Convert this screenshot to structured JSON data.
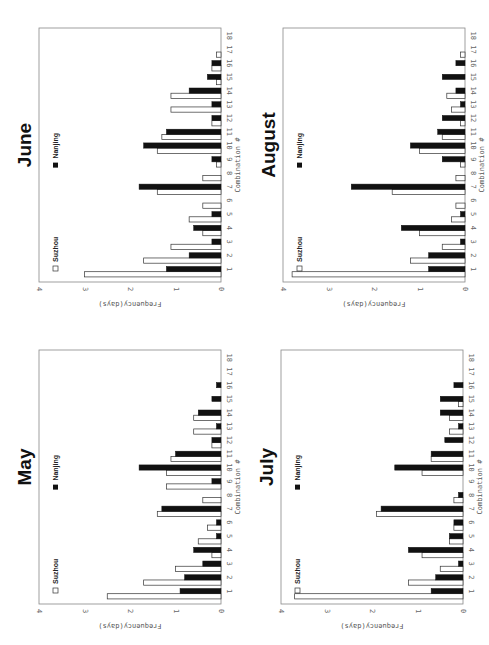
{
  "figure": {
    "orientation": "rotated 90deg clockwise (bars horizontal in screenshot)",
    "legend": {
      "suzhou_label": "Suzhou",
      "nanjing_label": "Nanjing"
    },
    "xlabel": "Combination #",
    "ylabel": "Frequency(days)",
    "colors": {
      "suzhou": "#ffffff",
      "nanjing": "#111111",
      "frame": "#888888"
    }
  },
  "chart_data": [
    {
      "type": "bar",
      "title": "June",
      "xlabel": "Combination #",
      "ylabel": "Frequency(days)",
      "ylim": [
        0,
        4
      ],
      "categories": [
        "1",
        "2",
        "3",
        "4",
        "5",
        "6",
        "7",
        "8",
        "9",
        "10",
        "11",
        "12",
        "13",
        "14",
        "15",
        "16",
        "17",
        "18"
      ],
      "series": [
        {
          "name": "Suzhou",
          "values": [
            3.0,
            1.7,
            1.1,
            0.4,
            0.7,
            0.4,
            1.4,
            0.4,
            0.1,
            1.4,
            1.3,
            0.2,
            1.1,
            1.1,
            0.1,
            0.2,
            0.1,
            0
          ]
        },
        {
          "name": "Nanjing",
          "values": [
            1.2,
            0.7,
            0.2,
            0.6,
            0.2,
            0,
            1.8,
            0,
            0.2,
            1.7,
            1.2,
            0.2,
            0.2,
            0.7,
            0.3,
            0.2,
            0,
            0
          ]
        }
      ],
      "legend_position": "upper-left (inside plot)",
      "grid": false
    },
    {
      "type": "bar",
      "title": "August",
      "xlabel": "Combination #",
      "ylabel": "Frequency(days)",
      "ylim": [
        0,
        4
      ],
      "categories": [
        "1",
        "2",
        "3",
        "4",
        "5",
        "6",
        "7",
        "8",
        "9",
        "10",
        "11",
        "12",
        "13",
        "14",
        "15",
        "16",
        "17",
        "18"
      ],
      "series": [
        {
          "name": "Suzhou",
          "values": [
            3.8,
            1.2,
            0.5,
            1.0,
            0.3,
            0.2,
            1.6,
            0.2,
            0.1,
            1.0,
            0.5,
            0.1,
            0.3,
            0.4,
            0,
            0,
            0.1,
            0
          ]
        },
        {
          "name": "Nanjing",
          "values": [
            0.8,
            0.8,
            0.1,
            1.4,
            0.1,
            0,
            2.5,
            0,
            0.5,
            1.2,
            0.6,
            0.5,
            0.1,
            0.2,
            0.5,
            0.2,
            0,
            0
          ]
        }
      ],
      "legend_position": "upper-left (inside plot)",
      "grid": false
    },
    {
      "type": "bar",
      "title": "May",
      "xlabel": "Combination #",
      "ylabel": "Frequency(days)",
      "ylim": [
        0,
        4
      ],
      "categories": [
        "1",
        "2",
        "3",
        "4",
        "5",
        "6",
        "7",
        "8",
        "9",
        "10",
        "11",
        "12",
        "13",
        "14",
        "15",
        "16",
        "17",
        "18"
      ],
      "series": [
        {
          "name": "Suzhou",
          "values": [
            2.5,
            1.7,
            1.0,
            0.2,
            0.5,
            0.3,
            1.4,
            0.4,
            1.2,
            1.2,
            1.1,
            0.2,
            0.6,
            0.6,
            0,
            0,
            0,
            0
          ]
        },
        {
          "name": "Nanjing",
          "values": [
            0.9,
            0.8,
            0.4,
            0.6,
            0.1,
            0.1,
            1.3,
            0,
            0.2,
            1.8,
            1.0,
            0.2,
            0.1,
            0.5,
            0.2,
            0.1,
            0,
            0
          ]
        }
      ],
      "legend_position": "upper-left (inside plot)",
      "grid": false
    },
    {
      "type": "bar",
      "title": "July",
      "xlabel": "Combination #",
      "ylabel": "Frequency(days)",
      "ylim": [
        0,
        4
      ],
      "categories": [
        "1",
        "2",
        "3",
        "4",
        "5",
        "6",
        "7",
        "8",
        "9",
        "10",
        "11",
        "12",
        "13",
        "14",
        "15",
        "16",
        "17",
        "18"
      ],
      "series": [
        {
          "name": "Suzhou",
          "values": [
            3.7,
            1.2,
            0.5,
            0.9,
            0.3,
            0.2,
            1.9,
            0.2,
            0,
            0.9,
            0.7,
            0,
            0.3,
            0.3,
            0.1,
            0,
            0,
            0
          ]
        },
        {
          "name": "Nanjing",
          "values": [
            0.7,
            0.6,
            0.1,
            1.2,
            0.3,
            0.2,
            1.8,
            0.1,
            0,
            1.5,
            0.7,
            0.4,
            0.1,
            0.5,
            0.5,
            0.2,
            0,
            0
          ]
        }
      ],
      "legend_position": "upper-left (inside plot)",
      "grid": false
    }
  ],
  "panels": [
    {
      "title": "June",
      "x": 0,
      "y": 0
    },
    {
      "title": "August",
      "x": 244,
      "y": 0
    },
    {
      "title": "May",
      "x": 0,
      "y": 322
    },
    {
      "title": "July",
      "x": 242,
      "y": 322
    }
  ],
  "axis": {
    "value_ticks": [
      "0",
      "1",
      "2",
      "3",
      "4"
    ],
    "category_ticks": [
      "1",
      "2",
      "3",
      "4",
      "5",
      "6",
      "7",
      "8",
      "9",
      "10",
      "11",
      "12",
      "13",
      "14",
      "15",
      "16",
      "17",
      "18"
    ]
  }
}
